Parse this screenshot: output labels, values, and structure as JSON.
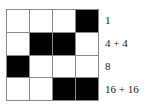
{
  "figure": {
    "name": "binary-grid-with-row-labels",
    "grid": {
      "rows": 4,
      "columns": 4,
      "gridline_color": "#8a8a8a",
      "filled_color": "#000000",
      "empty_color": "#ffffff",
      "filled_token": "black",
      "empty_token": "white",
      "cells": [
        [
          "white",
          "white",
          "white",
          "black"
        ],
        [
          "white",
          "black",
          "black",
          "white"
        ],
        [
          "black",
          "white",
          "white",
          "white"
        ],
        [
          "white",
          "white",
          "black",
          "black"
        ]
      ]
    },
    "row_labels": [
      {
        "text": "1"
      },
      {
        "text": "4 + 4"
      },
      {
        "text": "8"
      },
      {
        "text": "16 + 16"
      }
    ]
  }
}
